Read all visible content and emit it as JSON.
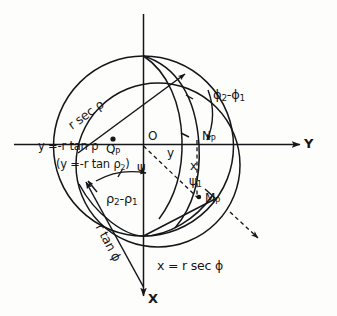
{
  "figure": {
    "kind": "geometry-diagram",
    "ink_color": "#15161a",
    "background_color": "#fdfdfb",
    "axes": {
      "y_axis_label": "Y",
      "x_axis_label": "X",
      "origin_label": "O"
    },
    "points": {
      "origin": "O",
      "q_point": "Q",
      "q_point_sub": "P",
      "n_point": "N",
      "n_point_sub": "P",
      "m_point": "M",
      "m_point_sub": "P"
    },
    "labels": {
      "r_sec_rho": "r sec ρ",
      "r_tan_phi": "r tan ϕ",
      "y_eq_minus_r_tan_rho": "y =-r tan ρ",
      "y_eq_minus_r_tan_rho_2_open": "(y =-r tan ρ",
      "y_eq_minus_r_tan_rho_2_sub": "2",
      "y_eq_minus_r_tan_rho_2_close": ")",
      "psi_after_paren": "ψ",
      "x_eq_r_sec_phi": "x = r sec ϕ",
      "small_y": "y",
      "small_x": "x",
      "psi_1": "ψ",
      "psi_1_sub": "1",
      "phi_diff_first": "ϕ",
      "phi_diff_first_sub": "2",
      "phi_diff_minus": "-",
      "phi_diff_second": "ϕ",
      "phi_diff_second_sub": "1",
      "rho_diff_first": "ρ",
      "rho_diff_first_sub": "2",
      "rho_diff_minus": "-",
      "rho_diff_second": "ρ",
      "rho_diff_second_sub": "1"
    }
  }
}
